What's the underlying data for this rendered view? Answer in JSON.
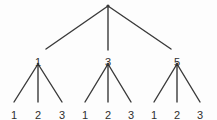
{
  "diagram": {
    "name": "three-level-tree",
    "type": "tree",
    "width": 217,
    "height": 120,
    "background_color": "#fdfdfd",
    "line_color": "#3a3a3a",
    "text_color": "#2f2f2f",
    "line_width": 1.4,
    "root": {
      "name": "root-node",
      "label": "",
      "x": 108,
      "y": 6
    },
    "internal_nodes": [
      {
        "name": "internal-node-1",
        "label": "1",
        "x": 38,
        "y": 57,
        "branch_x": 38,
        "branch_y": 64
      },
      {
        "name": "internal-node-2",
        "label": "3",
        "x": 108,
        "y": 57,
        "branch_x": 108,
        "branch_y": 64
      },
      {
        "name": "internal-node-3",
        "label": "5",
        "x": 177,
        "y": 57,
        "branch_x": 177,
        "branch_y": 64
      }
    ],
    "leaf_nodes": [
      {
        "name": "leaf-node-1-1",
        "label": "1",
        "x": 14,
        "y": 110,
        "parent": "internal-node-1",
        "tip_x": 14,
        "tip_y": 102
      },
      {
        "name": "leaf-node-1-2",
        "label": "2",
        "x": 38,
        "y": 110,
        "parent": "internal-node-1",
        "tip_x": 38,
        "tip_y": 102
      },
      {
        "name": "leaf-node-1-3",
        "label": "3",
        "x": 62,
        "y": 110,
        "parent": "internal-node-1",
        "tip_x": 62,
        "tip_y": 102
      },
      {
        "name": "leaf-node-2-1",
        "label": "1",
        "x": 85,
        "y": 110,
        "parent": "internal-node-2",
        "tip_x": 85,
        "tip_y": 102
      },
      {
        "name": "leaf-node-2-2",
        "label": "2",
        "x": 108,
        "y": 110,
        "parent": "internal-node-2",
        "tip_x": 108,
        "tip_y": 102
      },
      {
        "name": "leaf-node-2-3",
        "label": "3",
        "x": 131,
        "y": 110,
        "parent": "internal-node-2",
        "tip_x": 131,
        "tip_y": 102
      },
      {
        "name": "leaf-node-3-1",
        "label": "1",
        "x": 154,
        "y": 110,
        "parent": "internal-node-3",
        "tip_x": 154,
        "tip_y": 102
      },
      {
        "name": "leaf-node-3-2",
        "label": "2",
        "x": 177,
        "y": 110,
        "parent": "internal-node-3",
        "tip_x": 177,
        "tip_y": 102
      },
      {
        "name": "leaf-node-3-3",
        "label": "3",
        "x": 200,
        "y": 110,
        "parent": "internal-node-3",
        "tip_x": 200,
        "tip_y": 102
      }
    ],
    "edges_level1": [
      {
        "name": "root-edge-left",
        "x1": 108,
        "y1": 6,
        "x2": 46,
        "y2": 49
      },
      {
        "name": "root-edge-middle",
        "x1": 108,
        "y1": 6,
        "x2": 108,
        "y2": 50
      },
      {
        "name": "root-edge-right",
        "x1": 108,
        "y1": 6,
        "x2": 171,
        "y2": 49
      }
    ],
    "edges_level2": [
      {
        "name": "edge-1-to-leaf-1",
        "x1": 38,
        "y1": 64,
        "x2": 14,
        "y2": 102
      },
      {
        "name": "edge-1-to-leaf-2",
        "x1": 38,
        "y1": 64,
        "x2": 38,
        "y2": 102
      },
      {
        "name": "edge-1-to-leaf-3",
        "x1": 38,
        "y1": 64,
        "x2": 62,
        "y2": 102
      },
      {
        "name": "edge-3-to-leaf-1",
        "x1": 108,
        "y1": 64,
        "x2": 85,
        "y2": 102
      },
      {
        "name": "edge-3-to-leaf-2",
        "x1": 108,
        "y1": 64,
        "x2": 108,
        "y2": 102
      },
      {
        "name": "edge-3-to-leaf-3",
        "x1": 108,
        "y1": 64,
        "x2": 131,
        "y2": 102
      },
      {
        "name": "edge-5-to-leaf-1",
        "x1": 177,
        "y1": 64,
        "x2": 154,
        "y2": 102
      },
      {
        "name": "edge-5-to-leaf-2",
        "x1": 177,
        "y1": 64,
        "x2": 177,
        "y2": 102
      },
      {
        "name": "edge-5-to-leaf-3",
        "x1": 177,
        "y1": 64,
        "x2": 200,
        "y2": 102
      }
    ]
  }
}
